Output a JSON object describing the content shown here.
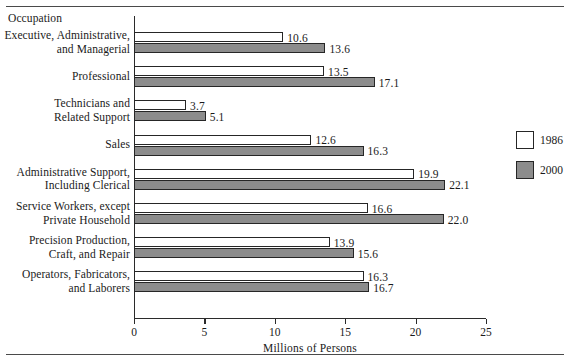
{
  "chart_data": {
    "type": "bar",
    "orientation": "horizontal",
    "title": "",
    "axis_title": "Occupation",
    "xlabel": "Millions of Persons",
    "ylabel": "Occupation",
    "xlim": [
      0,
      25
    ],
    "xticks": [
      0,
      5,
      10,
      15,
      20,
      25
    ],
    "xticklabels": [
      "0",
      "5",
      "10",
      "15",
      "20",
      "25"
    ],
    "grid": false,
    "legend_position": "right",
    "categories": [
      "Executive, Administrative,\nand Managerial",
      "Professional",
      "Technicians and\nRelated Support",
      "Sales",
      "Administrative Support,\nIncluding Clerical",
      "Service Workers, except\nPrivate Household",
      "Precision Production,\nCraft, and Repair",
      "Operators, Fabricators,\nand Laborers"
    ],
    "series": [
      {
        "name": "1986",
        "color": "#ffffff",
        "values": [
          10.6,
          13.5,
          3.7,
          12.6,
          19.9,
          16.6,
          13.9,
          16.3
        ],
        "labels": [
          "10.6",
          "13.5",
          "3.7",
          "12.6",
          "19.9",
          "16.6",
          "13.9",
          "16.3"
        ]
      },
      {
        "name": "2000",
        "color": "#8c8c8c",
        "values": [
          13.6,
          17.1,
          5.1,
          16.3,
          22.1,
          22.0,
          15.6,
          16.7
        ],
        "labels": [
          "13.6",
          "17.1",
          "5.1",
          "16.3",
          "22.1",
          "22.0",
          "15.6",
          "16.7"
        ]
      }
    ]
  },
  "legend": {
    "items": [
      {
        "label": "1986",
        "color": "#ffffff"
      },
      {
        "label": "2000",
        "color": "#8c8c8c"
      }
    ]
  },
  "colors": {
    "series_1986": "#ffffff",
    "series_2000": "#8c8c8c",
    "axis": "#2b2b2b",
    "rule": "#4a4a4a",
    "text": "#1a1a1a"
  }
}
